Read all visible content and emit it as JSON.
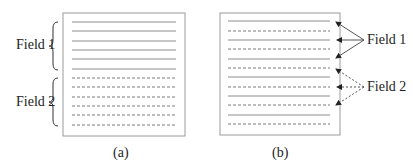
{
  "figure": {
    "panels": [
      {
        "id": "a",
        "caption": "(a)",
        "description": "Frame with fields stored separately: field 1 lines on top, field 2 lines below",
        "fields": [
          {
            "label": "Field 1",
            "line_style": "solid",
            "line_count": 6
          },
          {
            "label": "Field 2",
            "line_style": "dashed",
            "line_count": 6
          }
        ]
      },
      {
        "id": "b",
        "caption": "(b)",
        "description": "Interlaced frame: alternating field 1 (solid) and field 2 (dashed) lines",
        "fields": [
          {
            "label": "Field 1",
            "line_style": "solid",
            "line_count": 6
          },
          {
            "label": "Field 2",
            "line_style": "dashed",
            "line_count": 6
          }
        ]
      }
    ],
    "colors": {
      "frame": "#9a9a9a",
      "solid_line": "#8c8c8c",
      "dashed_line": "#7a7a7a",
      "arrow": "#333333",
      "text": "#222222"
    }
  }
}
